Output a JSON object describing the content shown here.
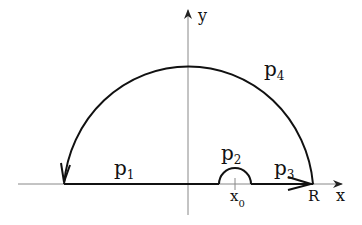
{
  "diagram": {
    "title": "",
    "axes": {
      "x_label": "x",
      "y_label": "y"
    },
    "points": {
      "x0_label": "x",
      "x0_sub": "0",
      "R_label": "R"
    },
    "paths": [
      {
        "id": "p1",
        "label": "p",
        "sub": "1",
        "description": "segment along x-axis from -R to x0 - eps"
      },
      {
        "id": "p2",
        "label": "p",
        "sub": "2",
        "description": "small upper semicircle around x0"
      },
      {
        "id": "p3",
        "label": "p",
        "sub": "3",
        "description": "segment along x-axis from x0 + eps to R"
      },
      {
        "id": "p4",
        "label": "p",
        "sub": "4",
        "description": "large upper semicircle of radius R, counterclockwise"
      }
    ],
    "colors": {
      "contour": "#111111",
      "axis": "#777777",
      "background": "#ffffff"
    }
  }
}
